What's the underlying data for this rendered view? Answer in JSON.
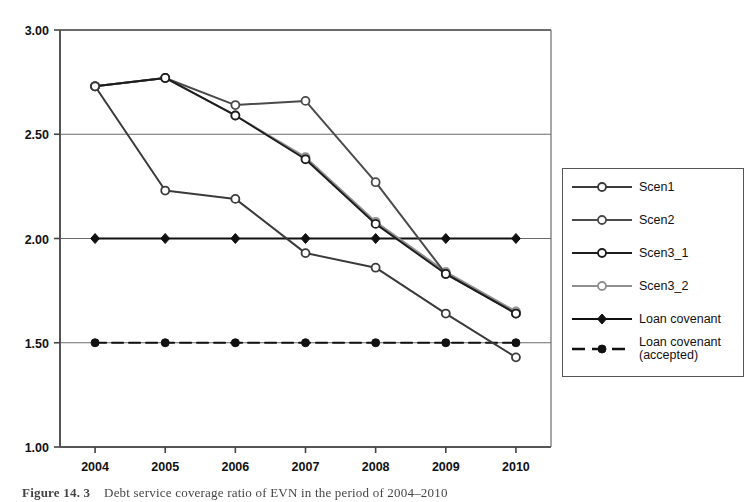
{
  "caption": {
    "label": "Figure 14. 3",
    "text": "Debt service coverage ratio of EVN in the period of 2004–2010"
  },
  "legend": {
    "position": "right",
    "items": [
      {
        "name": "Scen1",
        "marker": "open-circle",
        "line": "solid",
        "color": "#3a3a3a"
      },
      {
        "name": "Scen2",
        "marker": "open-circle",
        "line": "solid",
        "color": "#4a4a4a"
      },
      {
        "name": "Scen3_1",
        "marker": "open-circle",
        "line": "solid",
        "color": "#1d1d1d"
      },
      {
        "name": "Scen3_2",
        "marker": "open-circle",
        "line": "solid",
        "color": "#8f8f8f"
      },
      {
        "name": "Loan covenant",
        "marker": "filled-diamond",
        "line": "solid",
        "color": "#111111"
      },
      {
        "name": "Loan covenant\n(accepted)",
        "marker": "filled-circle",
        "line": "dashed",
        "color": "#111111"
      }
    ]
  },
  "chart_data": {
    "type": "line",
    "title": "",
    "xlabel": "",
    "ylabel": "",
    "categories": [
      "2004",
      "2005",
      "2006",
      "2007",
      "2008",
      "2009",
      "2010"
    ],
    "x": [
      2004,
      2005,
      2006,
      2007,
      2008,
      2009,
      2010
    ],
    "ylim": [
      1.0,
      3.0
    ],
    "yticks": [
      "1.00",
      "1.50",
      "2.00",
      "2.50",
      "3.00"
    ],
    "ytick_values": [
      1.0,
      1.5,
      2.0,
      2.5,
      3.0
    ],
    "grid": "horizontal",
    "legend_position": "right",
    "series": [
      {
        "name": "Scen1",
        "values": [
          2.73,
          2.23,
          2.19,
          1.93,
          1.86,
          1.64,
          1.43
        ],
        "marker": "open-circle",
        "line": "solid",
        "color": "#3a3a3a"
      },
      {
        "name": "Scen2",
        "values": [
          2.73,
          2.77,
          2.64,
          2.66,
          2.27,
          1.83,
          1.64
        ],
        "marker": "open-circle",
        "line": "solid",
        "color": "#4a4a4a"
      },
      {
        "name": "Scen3_1",
        "values": [
          2.73,
          2.77,
          2.59,
          2.38,
          2.07,
          1.83,
          1.64
        ],
        "marker": "open-circle",
        "line": "solid",
        "color": "#1d1d1d"
      },
      {
        "name": "Scen3_2",
        "values": [
          2.73,
          2.77,
          2.59,
          2.39,
          2.08,
          1.84,
          1.65
        ],
        "marker": "open-circle",
        "line": "solid",
        "color": "#8f8f8f"
      },
      {
        "name": "Loan covenant",
        "values": [
          2.0,
          2.0,
          2.0,
          2.0,
          2.0,
          2.0,
          2.0
        ],
        "marker": "filled-diamond",
        "line": "solid",
        "color": "#111111"
      },
      {
        "name": "Loan covenant (accepted)",
        "values": [
          1.5,
          1.5,
          1.5,
          1.5,
          1.5,
          1.5,
          1.5
        ],
        "marker": "filled-circle",
        "line": "dashed",
        "color": "#111111"
      }
    ]
  }
}
